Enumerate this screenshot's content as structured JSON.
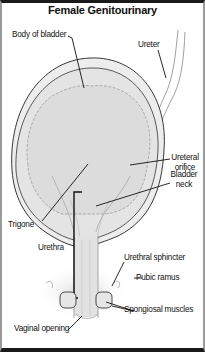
{
  "diagram": {
    "title": "Female Genitourinary",
    "labels": {
      "body_of_bladder": "Body of bladder",
      "ureter": "Ureter",
      "ureteral_orifice_line1": "Ureteral",
      "ureteral_orifice_line2": "orifice",
      "bladder_neck_line1": "Bladder",
      "bladder_neck_line2": "neck",
      "trigone": "Trigone",
      "urethra": "Urethra",
      "urethral_sphincter": "Urethral sphincter",
      "pubic_ramus": "Pubic ramus",
      "spongiosal_muscles": "Spongiosal muscles",
      "vaginal_opening": "Vaginal opening"
    },
    "colors": {
      "border_dark": "#1a1a1a",
      "border_side": "#9a9a9a",
      "tissue_fill": "#e6e6e6",
      "inner_fill": "#d9d9d9",
      "line": "#222222"
    }
  }
}
